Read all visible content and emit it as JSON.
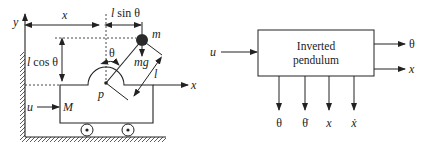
{
  "left_diagram": {
    "title": "Inverted pendulum on cart",
    "labels": {
      "y_axis": "y",
      "x_axis": "x",
      "x_distance": "x",
      "l_sin_theta": "l sin θ",
      "l_sin_theta_l": "l",
      "l_sin_theta_rest": " sin θ",
      "l_cos_theta_l": "l",
      "l_cos_theta_rest": " cos θ",
      "mass": "m",
      "theta": "θ",
      "gravity": "mg",
      "length": "l",
      "pivot": "p",
      "input_force": "u",
      "cart_mass": "M"
    }
  },
  "right_diagram": {
    "title": "Block diagram",
    "block": {
      "line1": "Inverted",
      "line2": "pendulum"
    },
    "input": "u",
    "right_outputs": [
      "θ",
      "x"
    ],
    "bottom_outputs": [
      "θ",
      "θ̇",
      "x",
      "ẋ"
    ]
  },
  "colors": {
    "stroke": "#222222",
    "mass_fill": "#2a2a2a",
    "background": "#ffffff"
  }
}
